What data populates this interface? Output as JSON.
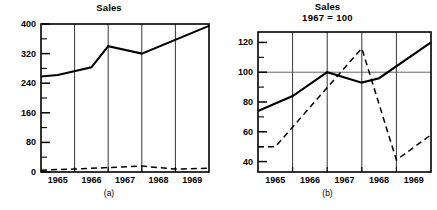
{
  "figure": {
    "panel_a": {
      "title": "Sales",
      "caption": "(a)"
    },
    "panel_b": {
      "title": "Sales",
      "subtitle": "1967 = 100",
      "caption": "(b)"
    }
  },
  "chart_data": [
    {
      "id": "panel-a",
      "type": "line",
      "title": "Sales",
      "subtitle": "",
      "caption": "(a)",
      "xlabel": "",
      "ylabel": "",
      "grid": "vertical-year-dividers",
      "legend": "none",
      "xlim": [
        1964.5,
        1969.5
      ],
      "ylim": [
        0,
        400
      ],
      "x_ticks": [
        1965,
        1966,
        1967,
        1968,
        1969
      ],
      "x_tick_labels": [
        "1965",
        "1966",
        "1967",
        "1968",
        "1969"
      ],
      "y_ticks_major": [
        0,
        80,
        160,
        240,
        320,
        400
      ],
      "y_tick_labels": [
        "0",
        "80",
        "160",
        "240",
        "320",
        "400"
      ],
      "y_ticks_minor": [
        40,
        120,
        200,
        280,
        360
      ],
      "series": [
        {
          "name": "sales-solid",
          "style": "solid",
          "x": [
            1964.5,
            1965,
            1966,
            1966.5,
            1967.5,
            1969.5
          ],
          "values": [
            258,
            262,
            283,
            340,
            320,
            395
          ]
        },
        {
          "name": "sales-dashed",
          "style": "dashed",
          "x": [
            1964.5,
            1965.5,
            1966.5,
            1967.5,
            1968.5,
            1969.5
          ],
          "values": [
            5,
            8,
            12,
            16,
            8,
            10
          ]
        }
      ]
    },
    {
      "id": "panel-b",
      "type": "line",
      "title": "Sales",
      "subtitle": "1967 = 100",
      "caption": "(b)",
      "xlabel": "",
      "ylabel": "",
      "grid": "vertical-year-dividers + horizontal line at 100",
      "legend": "none",
      "xlim": [
        1964.5,
        1969.5
      ],
      "ylim": [
        33,
        127
      ],
      "x_ticks": [
        1965,
        1966,
        1967,
        1968,
        1969
      ],
      "x_tick_labels": [
        "1965",
        "1966",
        "1967",
        "1968",
        "1969"
      ],
      "y_ticks_major": [
        40,
        60,
        80,
        100,
        120
      ],
      "y_tick_labels": [
        "40",
        "60",
        "80",
        "100",
        "120"
      ],
      "y_ticks_minor": [
        50,
        70,
        90,
        110
      ],
      "reference_line": 100,
      "series": [
        {
          "name": "index-solid",
          "style": "solid",
          "x": [
            1964.5,
            1965.5,
            1966.5,
            1967.5,
            1968.0,
            1969.5
          ],
          "values": [
            74,
            84,
            100,
            93,
            96,
            120
          ]
        },
        {
          "name": "index-dashed",
          "style": "dashed",
          "x": [
            1964.5,
            1965.0,
            1967.5,
            1968.5,
            1969.5
          ],
          "values": [
            50,
            50,
            116,
            41,
            58
          ]
        }
      ]
    }
  ]
}
